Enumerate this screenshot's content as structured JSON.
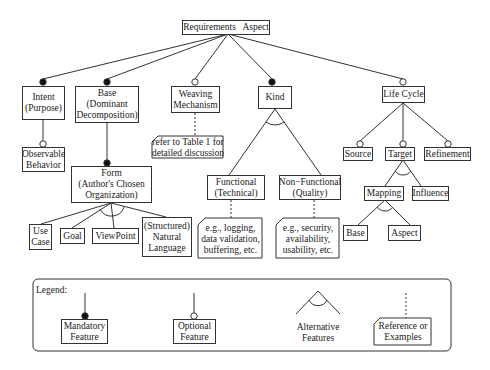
{
  "root": {
    "label": "Requirements   Aspect"
  },
  "level1": {
    "intent": {
      "lines": [
        "Intent",
        "(Purpose)"
      ],
      "type": "mandatory"
    },
    "base": {
      "lines": [
        "Base",
        "(Dominant",
        "Decomposition)"
      ],
      "type": "mandatory"
    },
    "weaving": {
      "lines": [
        "Weaving",
        "Mechanism"
      ],
      "type": "optional"
    },
    "kind": {
      "lines": [
        "Kind"
      ],
      "type": "mandatory"
    },
    "lifecycle": {
      "lines": [
        "Life Cycle"
      ],
      "type": "optional"
    }
  },
  "intent_children": {
    "observable": {
      "lines": [
        "Observable",
        "Behavior"
      ],
      "type": "optional"
    }
  },
  "base_children": {
    "form": {
      "lines": [
        "Form",
        "(Author's Chosen",
        "Organization)"
      ],
      "type": "mandatory"
    }
  },
  "form_children": {
    "usecase": {
      "lines": [
        "Use",
        "Case"
      ]
    },
    "goal": {
      "lines": [
        "Goal"
      ]
    },
    "viewpoint": {
      "lines": [
        "ViewPoint"
      ]
    },
    "natural": {
      "lines": [
        "(Structured)",
        "Natural",
        "Language"
      ]
    }
  },
  "weaving_note": {
    "lines": [
      "refer to Table 1 for",
      "detailed discussion"
    ]
  },
  "kind_children": {
    "functional": {
      "lines": [
        "Functional",
        "(Technical)"
      ]
    },
    "nonfunctional": {
      "lines": [
        "Non−Functional",
        "(Quality)"
      ]
    }
  },
  "functional_note": {
    "lines": [
      "e.g., logging,",
      "data validation,",
      "buffering, etc."
    ]
  },
  "nonfunctional_note": {
    "lines": [
      "e.g., security,",
      "availability,",
      "usability, etc."
    ]
  },
  "lifecycle_children": {
    "source": {
      "lines": [
        "Source"
      ],
      "type": "optional"
    },
    "target": {
      "lines": [
        "Target"
      ],
      "type": "optional"
    },
    "refinement": {
      "lines": [
        "Refinement"
      ],
      "type": "optional"
    }
  },
  "target_children": {
    "mapping": {
      "lines": [
        "Mapping"
      ]
    },
    "influence": {
      "lines": [
        "Influence"
      ]
    }
  },
  "mapping_children": {
    "base": {
      "lines": [
        "Base"
      ]
    },
    "aspect": {
      "lines": [
        "Aspect"
      ]
    }
  },
  "legend": {
    "title": "Legend:",
    "mandatory": {
      "lines": [
        "Mandatory",
        "Feature"
      ]
    },
    "optional": {
      "lines": [
        "Optional",
        "Feature"
      ]
    },
    "alternative": {
      "lines": [
        "Alternative",
        "Features"
      ]
    },
    "reference": {
      "lines": [
        "Reference or",
        "Examples"
      ]
    }
  },
  "colors": {
    "stroke": "#333333",
    "fill_mandatory": "#111111",
    "background": "#ffffff"
  }
}
